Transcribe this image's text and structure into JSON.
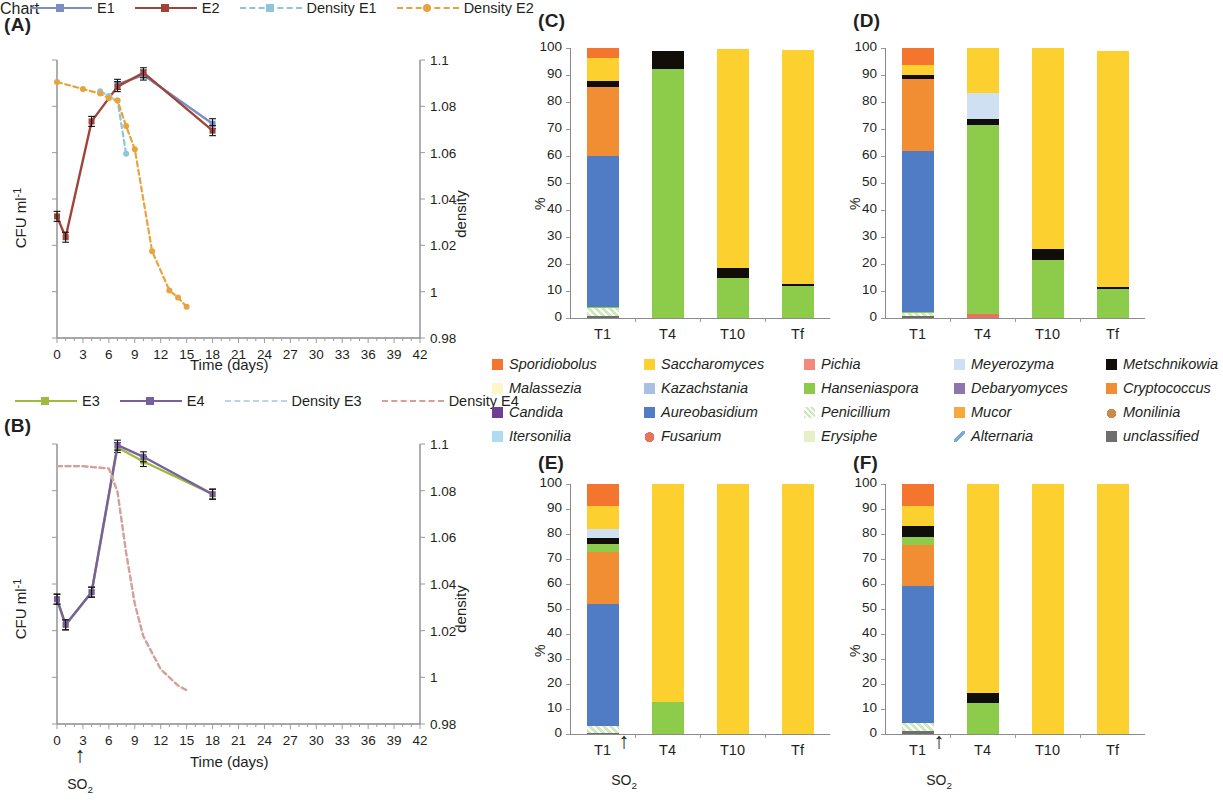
{
  "figure": {
    "panels": [
      "(A)",
      "(B)",
      "(C)",
      "(D)",
      "(E)",
      "(F)"
    ]
  },
  "panelA": {
    "tag": "(A)",
    "legend": [
      {
        "label": "E1",
        "color": "#7b8fc4",
        "style": "solid",
        "marker": "square"
      },
      {
        "label": "E2",
        "color": "#a0443a",
        "style": "solid",
        "marker": "square"
      },
      {
        "label": "Density E1",
        "color": "#8ec5dd",
        "style": "dashed",
        "marker": "square"
      },
      {
        "label": "Density E2",
        "color": "#e8a33d",
        "style": "dashed",
        "marker": "circle"
      }
    ],
    "ylabel_left": "CFU ml",
    "ylabel_left_sup": "-1",
    "ylabel_right": "density",
    "xlabel": "Time (days)",
    "xticks": [
      0,
      3,
      6,
      9,
      12,
      15,
      18,
      21,
      24,
      27,
      30,
      33,
      36,
      39,
      42
    ],
    "yticks_right": [
      "1.1",
      "1.08",
      "1.06",
      "1.04",
      "1.02",
      "1",
      "0.98"
    ]
  },
  "panelB": {
    "tag": "(B)",
    "legend": [
      {
        "label": "E3",
        "color": "#9dbb3c",
        "style": "solid",
        "marker": "square"
      },
      {
        "label": "E4",
        "color": "#7860a0",
        "style": "solid",
        "marker": "square"
      },
      {
        "label": "Density E3",
        "color": "#bcd4e8",
        "style": "dashed",
        "marker": "none"
      },
      {
        "label": "Density E4",
        "color": "#d99f96",
        "style": "dashed",
        "marker": "none"
      }
    ],
    "ylabel_left": "CFU ml",
    "ylabel_left_sup": "-1",
    "ylabel_right": "density",
    "xlabel": "Time (days)",
    "xticks": [
      0,
      3,
      6,
      9,
      12,
      15,
      18,
      21,
      24,
      27,
      30,
      33,
      36,
      39,
      42
    ],
    "yticks_right": [
      "1.1",
      "1.08",
      "1.06",
      "1.04",
      "1.02",
      "1",
      "0.98"
    ],
    "annotation": "SO2"
  },
  "taxa_legend": [
    {
      "name": "Sporidiobolus",
      "color": "#f4762e"
    },
    {
      "name": "Saccharomyces",
      "color": "#fbd02f"
    },
    {
      "name": "Pichia",
      "color": "#f4887c"
    },
    {
      "name": "Meyerozyma",
      "color": "#cfe0f3"
    },
    {
      "name": "Metschnikowia",
      "color": "#110d08"
    },
    {
      "name": "Malassezia",
      "color": "#fbf7c8"
    },
    {
      "name": "Kazachstania",
      "color": "#a9bfe3"
    },
    {
      "name": "Hanseniaspora",
      "color": "#8dcb4a"
    },
    {
      "name": "Debaryomyces",
      "color": "#8d76ae"
    },
    {
      "name": "Cryptococcus",
      "color": "#f18e34"
    },
    {
      "name": "Candida",
      "color": "#6f3f91"
    },
    {
      "name": "Aureobasidium",
      "color": "#4f7cc4"
    },
    {
      "name": "Penicillium",
      "color": "#cfe9bb"
    },
    {
      "name": "Mucor",
      "color": "#f7a93b"
    },
    {
      "name": "Monilinia",
      "color": "#c98a4e"
    },
    {
      "name": "Itersonilia",
      "color": "#aedcf0"
    },
    {
      "name": "Fusarium",
      "color": "#e8735c"
    },
    {
      "name": "Erysiphe",
      "color": "#e6efc5"
    },
    {
      "name": "Alternaria",
      "color": "#7aa8d8"
    },
    {
      "name": "unclassified",
      "color": "#6e6e6e"
    }
  ],
  "bar_axis": {
    "ylabel": "%",
    "yticks": [
      0,
      10,
      20,
      30,
      40,
      50,
      60,
      70,
      80,
      90,
      100
    ],
    "categories": [
      "T1",
      "T4",
      "T10",
      "Tf"
    ],
    "so2_label": "SO2"
  },
  "chart_data": [
    {
      "type": "line",
      "panel": "(A)",
      "title": "",
      "xlabel": "Time (days)",
      "ylabel": "CFU ml-1",
      "y2label": "density",
      "xlim": [
        0,
        42
      ],
      "y2lim": [
        0.98,
        1.1
      ],
      "grid": false,
      "legend_position": "top",
      "series": [
        {
          "name": "E1",
          "axis": "left",
          "color": "#7b8fc4",
          "style": "solid",
          "x": [
            7,
            10,
            18
          ],
          "y": [
            1.0895,
            1.0935,
            1.0725
          ]
        },
        {
          "name": "E2",
          "axis": "left",
          "color": "#a0443a",
          "style": "solid",
          "x": [
            0,
            1,
            4,
            7,
            10,
            18
          ],
          "y": [
            1.0325,
            1.0235,
            1.0735,
            1.0885,
            1.0945,
            1.0695
          ]
        },
        {
          "name": "Density E1",
          "axis": "right",
          "color": "#8ec5dd",
          "style": "dashed",
          "x": [
            5,
            6,
            7,
            8
          ],
          "y": [
            1.0865,
            1.0845,
            1.0825,
            1.0595
          ]
        },
        {
          "name": "Density E2",
          "axis": "right",
          "color": "#e8a33d",
          "style": "dashed",
          "x": [
            0,
            3,
            5,
            6,
            7,
            8,
            9,
            11,
            13,
            14,
            15
          ],
          "y": [
            1.0905,
            1.0875,
            1.0855,
            1.0835,
            1.0825,
            1.0715,
            1.0615,
            1.0175,
            1.0005,
            0.9975,
            0.9935
          ]
        }
      ]
    },
    {
      "type": "line",
      "panel": "(B)",
      "title": "",
      "xlabel": "Time (days)",
      "ylabel": "CFU ml-1",
      "y2label": "density",
      "xlim": [
        0,
        42
      ],
      "y2lim": [
        0.98,
        1.1
      ],
      "grid": false,
      "legend_position": "top",
      "series": [
        {
          "name": "E3",
          "axis": "left",
          "color": "#9dbb3c",
          "style": "solid",
          "x": [
            0,
            1,
            4,
            7,
            10,
            18
          ],
          "y": [
            1.0335,
            1.0225,
            1.0365,
            1.0985,
            1.0925,
            1.0785
          ]
        },
        {
          "name": "E4",
          "axis": "left",
          "color": "#7860a0",
          "style": "solid",
          "x": [
            0,
            1,
            4,
            7,
            10,
            18
          ],
          "y": [
            1.0335,
            1.0225,
            1.0365,
            1.0995,
            1.0945,
            1.0785
          ]
        },
        {
          "name": "Density E3",
          "axis": "right",
          "color": "#bcd4e8",
          "style": "dashed",
          "x": [
            0,
            3,
            6,
            7,
            8,
            9,
            10,
            12,
            14,
            15
          ],
          "y": [
            1.0905,
            1.0905,
            1.0895,
            1.0795,
            1.0535,
            1.0315,
            1.0175,
            1.0035,
            0.9965,
            0.9945
          ]
        },
        {
          "name": "Density E4",
          "axis": "right",
          "color": "#d99f96",
          "style": "dashed",
          "x": [
            0,
            3,
            6,
            7,
            8,
            9,
            10,
            12,
            14,
            15
          ],
          "y": [
            1.0905,
            1.0905,
            1.0895,
            1.0795,
            1.0535,
            1.0315,
            1.0175,
            1.0035,
            0.9965,
            0.9945
          ]
        }
      ],
      "annotation": {
        "text": "SO2",
        "x": 1
      }
    },
    {
      "type": "bar",
      "subtype": "stacked-100",
      "panel": "(C)",
      "ylabel": "%",
      "ylim": [
        0,
        100
      ],
      "categories": [
        "T1",
        "T4",
        "T10",
        "Tf"
      ],
      "series": [
        {
          "name": "unclassified",
          "color": "#6e6e6e",
          "values": [
            0.8,
            0.0,
            0.0,
            0.0
          ]
        },
        {
          "name": "Penicillium",
          "color": "#cfe9bb",
          "values": [
            3.0,
            0.0,
            0.0,
            0.0
          ]
        },
        {
          "name": "Hanseniaspora",
          "color": "#8dcb4a",
          "values": [
            0.4,
            92.1,
            14.9,
            11.8
          ]
        },
        {
          "name": "Aureobasidium",
          "color": "#4f7cc4",
          "values": [
            55.8,
            0.0,
            0.0,
            0.0
          ]
        },
        {
          "name": "Cryptococcus",
          "color": "#f18e34",
          "values": [
            25.5,
            0.0,
            0.0,
            0.0
          ]
        },
        {
          "name": "Metschnikowia",
          "color": "#110d08",
          "values": [
            2.3,
            6.9,
            3.7,
            0.9
          ]
        },
        {
          "name": "Saccharomyces",
          "color": "#fbd02f",
          "values": [
            8.6,
            0.0,
            80.9,
            86.5
          ]
        },
        {
          "name": "Sporidiobolus",
          "color": "#f4762e",
          "values": [
            3.6,
            0.0,
            0.0,
            0.0
          ]
        }
      ]
    },
    {
      "type": "bar",
      "subtype": "stacked-100",
      "panel": "(D)",
      "ylabel": "%",
      "ylim": [
        0,
        100
      ],
      "categories": [
        "T1",
        "T4",
        "T10",
        "Tf"
      ],
      "series": [
        {
          "name": "unclassified",
          "color": "#6e6e6e",
          "values": [
            0.7,
            0.0,
            0.0,
            0.0
          ]
        },
        {
          "name": "Penicillium",
          "color": "#cfe9bb",
          "values": [
            1.2,
            0.0,
            0.0,
            0.0
          ]
        },
        {
          "name": "Fusarium",
          "color": "#e8735c",
          "values": [
            0.0,
            1.6,
            0.0,
            0.0
          ]
        },
        {
          "name": "Hanseniaspora",
          "color": "#8dcb4a",
          "values": [
            0.3,
            69.9,
            21.3,
            10.8
          ]
        },
        {
          "name": "Aureobasidium",
          "color": "#4f7cc4",
          "values": [
            59.7,
            0.0,
            0.0,
            0.0
          ]
        },
        {
          "name": "Cryptococcus",
          "color": "#f18e34",
          "values": [
            26.7,
            0.0,
            0.0,
            0.0
          ]
        },
        {
          "name": "Metschnikowia",
          "color": "#110d08",
          "values": [
            1.5,
            2.1,
            4.3,
            0.7
          ]
        },
        {
          "name": "Meyerozyma",
          "color": "#cfe0f3",
          "values": [
            0.0,
            9.6,
            0.0,
            0.0
          ]
        },
        {
          "name": "Saccharomyces",
          "color": "#fbd02f",
          "values": [
            3.7,
            16.8,
            74.4,
            87.5
          ]
        },
        {
          "name": "Sporidiobolus",
          "color": "#f4762e",
          "values": [
            6.2,
            0.0,
            0.0,
            0.0
          ]
        }
      ]
    },
    {
      "type": "bar",
      "subtype": "stacked-100",
      "panel": "(E)",
      "ylabel": "%",
      "ylim": [
        0,
        100
      ],
      "categories": [
        "T1",
        "T4",
        "T10",
        "Tf"
      ],
      "series": [
        {
          "name": "unclassified",
          "color": "#6e6e6e",
          "values": [
            0.6,
            0.0,
            0.0,
            0.0
          ]
        },
        {
          "name": "Penicillium",
          "color": "#cfe9bb",
          "values": [
            2.6,
            0.0,
            0.0,
            0.0
          ]
        },
        {
          "name": "Aureobasidium",
          "color": "#4f7cc4",
          "values": [
            48.7,
            0.0,
            0.0,
            0.0
          ]
        },
        {
          "name": "Cryptococcus",
          "color": "#f18e34",
          "values": [
            21.0,
            0.0,
            0.0,
            0.0
          ]
        },
        {
          "name": "Hanseniaspora",
          "color": "#8dcb4a",
          "values": [
            3.3,
            12.7,
            0.0,
            0.0
          ]
        },
        {
          "name": "Metschnikowia",
          "color": "#110d08",
          "values": [
            2.4,
            0.0,
            0.0,
            0.0
          ]
        },
        {
          "name": "Meyerozyma",
          "color": "#cfe0f3",
          "values": [
            3.3,
            0.0,
            0.0,
            0.0
          ]
        },
        {
          "name": "Saccharomyces",
          "color": "#fbd02f",
          "values": [
            9.3,
            87.3,
            100.0,
            100.0
          ]
        },
        {
          "name": "Sporidiobolus",
          "color": "#f4762e",
          "values": [
            8.8,
            0.0,
            0.0,
            0.0
          ]
        }
      ]
    },
    {
      "type": "bar",
      "subtype": "stacked-100",
      "panel": "(F)",
      "ylabel": "%",
      "ylim": [
        0,
        100
      ],
      "categories": [
        "T1",
        "T4",
        "T10",
        "Tf"
      ],
      "series": [
        {
          "name": "unclassified",
          "color": "#6e6e6e",
          "values": [
            1.1,
            0.0,
            0.0,
            0.0
          ]
        },
        {
          "name": "Penicillium",
          "color": "#cfe9bb",
          "values": [
            3.2,
            0.0,
            0.0,
            0.0
          ]
        },
        {
          "name": "Aureobasidium",
          "color": "#4f7cc4",
          "values": [
            55.1,
            0.0,
            0.0,
            0.0
          ]
        },
        {
          "name": "Cryptococcus",
          "color": "#f18e34",
          "values": [
            16.1,
            0.0,
            0.0,
            0.0
          ]
        },
        {
          "name": "Hanseniaspora",
          "color": "#8dcb4a",
          "values": [
            3.4,
            12.3,
            0.0,
            0.0
          ]
        },
        {
          "name": "Metschnikowia",
          "color": "#110d08",
          "values": [
            4.4,
            4.0,
            0.0,
            0.0
          ]
        },
        {
          "name": "Saccharomyces",
          "color": "#fbd02f",
          "values": [
            8.0,
            83.7,
            100.0,
            100.0
          ]
        },
        {
          "name": "Sporidiobolus",
          "color": "#f4762e",
          "values": [
            8.7,
            0.0,
            0.0,
            0.0
          ]
        }
      ]
    }
  ]
}
